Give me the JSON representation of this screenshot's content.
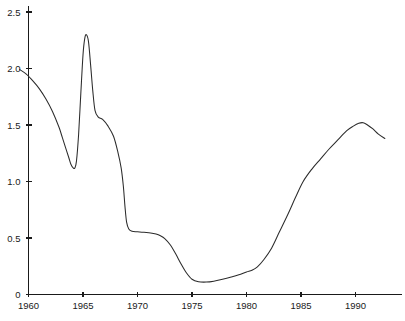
{
  "chart_data": {
    "type": "line",
    "title": "",
    "subtitle": "",
    "xlabel": "",
    "ylabel": "",
    "xlim": [
      1959.2,
      1992.8
    ],
    "ylim": [
      0,
      2.5
    ],
    "grid": false,
    "legend": null,
    "legend_position": "none",
    "x_ticks": [
      1960,
      1965,
      1970,
      1975,
      1980,
      1985,
      1990
    ],
    "x_tick_labels": [
      "1960",
      "1965",
      "1970",
      "1975",
      "1980",
      "1985",
      "1990"
    ],
    "y_ticks": [
      0,
      0.5,
      1.0,
      1.5,
      2.0,
      2.5
    ],
    "y_tick_labels": [
      "0",
      "0.5",
      "1.0",
      "1.5",
      "2.0",
      "2.5"
    ],
    "series": [
      {
        "name": "series-1",
        "color": "#2b2b2b",
        "x": [
          1959.2,
          1959.8,
          1960.4,
          1961.0,
          1961.6,
          1962.2,
          1962.8,
          1963.1,
          1963.4,
          1963.7,
          1963.9,
          1964.1,
          1964.25,
          1964.4,
          1964.6,
          1964.8,
          1965.0,
          1965.15,
          1965.3,
          1965.5,
          1965.7,
          1965.9,
          1966.1,
          1966.4,
          1966.8,
          1967.3,
          1967.8,
          1968.2,
          1968.5,
          1968.7,
          1968.85,
          1969.0,
          1969.2,
          1969.5,
          1970.0,
          1970.6,
          1971.2,
          1971.7,
          1972.1,
          1972.5,
          1973.0,
          1973.5,
          1974.0,
          1974.5,
          1975.0,
          1975.6,
          1976.3,
          1977.0,
          1977.8,
          1978.6,
          1979.3,
          1980.0,
          1980.5,
          1981.0,
          1981.6,
          1982.3,
          1983.0,
          1983.8,
          1984.5,
          1985.2,
          1986.0,
          1986.8,
          1987.6,
          1988.4,
          1989.2,
          1989.8,
          1990.3,
          1990.7,
          1991.1,
          1991.6,
          1992.1,
          1992.7
        ],
        "y": [
          1.99,
          1.95,
          1.89,
          1.82,
          1.73,
          1.62,
          1.48,
          1.39,
          1.3,
          1.21,
          1.15,
          1.12,
          1.12,
          1.18,
          1.42,
          1.78,
          2.12,
          2.26,
          2.3,
          2.24,
          2.03,
          1.8,
          1.63,
          1.57,
          1.55,
          1.49,
          1.4,
          1.26,
          1.12,
          0.96,
          0.78,
          0.64,
          0.58,
          0.56,
          0.555,
          0.55,
          0.545,
          0.535,
          0.52,
          0.495,
          0.44,
          0.36,
          0.27,
          0.19,
          0.135,
          0.113,
          0.11,
          0.118,
          0.135,
          0.155,
          0.175,
          0.2,
          0.215,
          0.245,
          0.31,
          0.41,
          0.55,
          0.71,
          0.86,
          1.0,
          1.11,
          1.2,
          1.29,
          1.37,
          1.45,
          1.49,
          1.515,
          1.52,
          1.5,
          1.465,
          1.42,
          1.38
        ]
      }
    ]
  },
  "axes": {
    "y_axis_name": "y-axis",
    "x_axis_name": "x-axis"
  }
}
